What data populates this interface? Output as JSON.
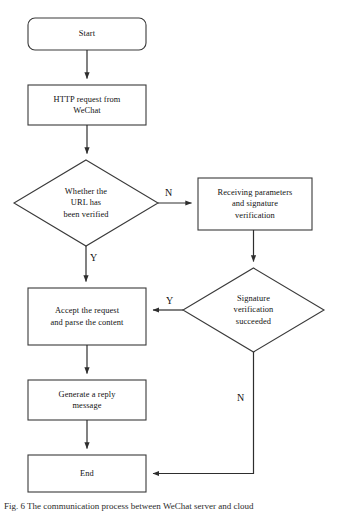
{
  "diagram": {
    "type": "flowchart",
    "orientation": "top-to-bottom",
    "background_color": "#ffffff",
    "stroke_color": "#3a3a3a",
    "text_color": "#111111",
    "nodes": [
      {
        "id": "start",
        "label": "Start",
        "shape": "rounded-rectangle",
        "x": 28,
        "y": 18,
        "width": 118,
        "height": 32
      },
      {
        "id": "http-request",
        "label": "HTTP request from\nWeChat",
        "shape": "rectangle",
        "x": 28,
        "y": 85,
        "width": 118,
        "height": 40
      },
      {
        "id": "url-verified-decision",
        "label": "Whether the\nURL has\nbeen verified",
        "shape": "diamond",
        "x": 14,
        "y": 160,
        "width": 144,
        "height": 86
      },
      {
        "id": "receiving-parameters",
        "label": "Receiving parameters\nand signature\nverification",
        "shape": "rectangle",
        "x": 198,
        "y": 178,
        "width": 114,
        "height": 52
      },
      {
        "id": "signature-decision",
        "label": "Signature\nverification\nsucceeded",
        "shape": "diamond",
        "x": 183,
        "y": 268,
        "width": 141,
        "height": 84
      },
      {
        "id": "accept-request",
        "label": "Accept the request\nand parse the content",
        "shape": "rectangle",
        "x": 28,
        "y": 288,
        "width": 118,
        "height": 57
      },
      {
        "id": "generate-reply",
        "label": "Generate a reply\nmessage",
        "shape": "rectangle",
        "x": 28,
        "y": 380,
        "width": 118,
        "height": 40
      },
      {
        "id": "end",
        "label": "End",
        "shape": "rectangle",
        "x": 28,
        "y": 455,
        "width": 118,
        "height": 37
      }
    ],
    "edges": [
      {
        "id": "start-to-http",
        "from": "start",
        "to": "http-request",
        "label": ""
      },
      {
        "id": "http-to-decision",
        "from": "http-request",
        "to": "url-verified-decision",
        "label": ""
      },
      {
        "id": "decision-no-to-receiving",
        "from": "url-verified-decision",
        "to": "receiving-parameters",
        "label": "N"
      },
      {
        "id": "decision-yes-to-accept",
        "from": "url-verified-decision",
        "to": "accept-request",
        "label": "Y"
      },
      {
        "id": "receiving-to-signature",
        "from": "receiving-parameters",
        "to": "signature-decision",
        "label": ""
      },
      {
        "id": "signature-yes-to-accept",
        "from": "signature-decision",
        "to": "accept-request",
        "label": "Y"
      },
      {
        "id": "signature-no-to-end",
        "from": "signature-decision",
        "to": "end",
        "label": "N"
      },
      {
        "id": "accept-to-generate",
        "from": "accept-request",
        "to": "generate-reply",
        "label": ""
      },
      {
        "id": "generate-to-end",
        "from": "generate-reply",
        "to": "end",
        "label": ""
      }
    ],
    "edge_labels": [
      {
        "id": "label-n-top",
        "text": "N",
        "x": 165,
        "y": 188
      },
      {
        "id": "label-y-left",
        "text": "Y",
        "x": 90,
        "y": 253
      },
      {
        "id": "label-y-mid",
        "text": "Y",
        "x": 166,
        "y": 296
      },
      {
        "id": "label-n-bottom",
        "text": "N",
        "x": 237,
        "y": 393
      }
    ]
  },
  "caption": {
    "text": "Fig. 6   The communication process between WeChat server and cloud"
  }
}
